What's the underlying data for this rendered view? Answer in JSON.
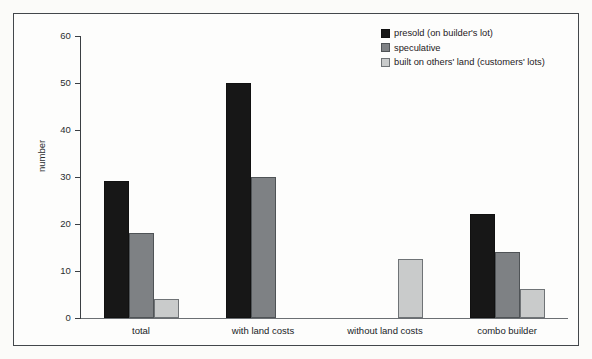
{
  "chart_data": {
    "type": "bar",
    "title": "",
    "xlabel": "",
    "ylabel": "number",
    "ylim": [
      0,
      60
    ],
    "yticks": [
      0,
      10,
      20,
      30,
      40,
      50,
      60
    ],
    "ytick_labels": [
      "0",
      "10",
      "20",
      "30",
      "40",
      "50",
      "60"
    ],
    "grid": false,
    "legend_position": "top-right",
    "categories": [
      "total",
      "with land costs",
      "without land costs",
      "combo builder"
    ],
    "series": [
      {
        "name": "presold (on builder's lot)",
        "color": "#171717",
        "values": [
          29,
          50,
          null,
          22
        ]
      },
      {
        "name": "speculative",
        "color": "#7e8184",
        "values": [
          18,
          30,
          null,
          14
        ]
      },
      {
        "name": "built on others' land (customers' lots)",
        "color": "#c9cbcb",
        "values": [
          4,
          null,
          12.5,
          6
        ]
      }
    ]
  },
  "axes": {
    "y_title": "number",
    "y_ticks": [
      {
        "label": "60",
        "value": 60
      },
      {
        "label": "50",
        "value": 50
      },
      {
        "label": "40",
        "value": 40
      },
      {
        "label": "30",
        "value": 30
      },
      {
        "label": "20",
        "value": 20
      },
      {
        "label": "10",
        "value": 10
      },
      {
        "label": "0",
        "value": 0
      }
    ],
    "x_categories": [
      {
        "label": "total"
      },
      {
        "label": "with land costs"
      },
      {
        "label": "without land costs"
      },
      {
        "label": "combo builder"
      }
    ]
  },
  "legend": {
    "items": [
      {
        "label": "presold (on builder's lot)",
        "color": "#171717"
      },
      {
        "label": "speculative",
        "color": "#7e8184"
      },
      {
        "label": "built on others' land (customers' lots)",
        "color": "#c9cbcb"
      }
    ]
  }
}
